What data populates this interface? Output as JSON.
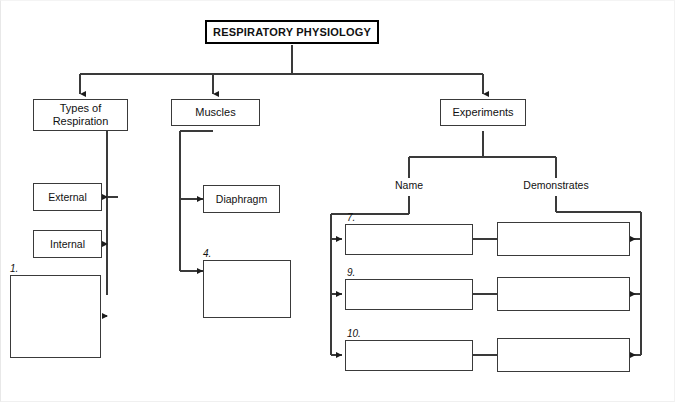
{
  "worksheet": {
    "title": "RESPIRATORY PHYSIOLOGY",
    "level2": {
      "types_of_respiration": "Types of\nRespiration",
      "muscles": "Muscles",
      "experiments": "Experiments"
    },
    "column_headers": {
      "name": "Name",
      "demonstrates": "Demonstrates"
    },
    "types_branch": {
      "external": "External",
      "internal": "Internal",
      "blank_1_number": "1.",
      "blank_1_value": ""
    },
    "muscles_branch": {
      "diaphragm": "Diaphragm",
      "blank_4_number": "4.",
      "blank_4_value": ""
    },
    "experiment_rows": [
      {
        "number": "7.",
        "name_value": "",
        "demonstrates_value": ""
      },
      {
        "number": "9.",
        "name_value": "",
        "demonstrates_value": ""
      },
      {
        "number": "10.",
        "name_value": "",
        "demonstrates_value": ""
      }
    ],
    "colors": {
      "line": "#3a3a3a",
      "title_border": "#000000",
      "text": "#111111",
      "background": "#ffffff"
    }
  }
}
